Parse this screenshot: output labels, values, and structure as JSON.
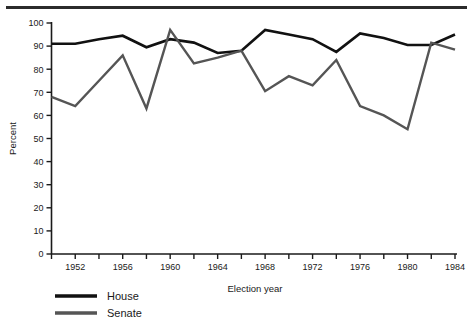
{
  "chart_data": {
    "type": "line",
    "title": "",
    "xlabel": "Election year",
    "ylabel": "Percent",
    "xlim": [
      1950,
      1984
    ],
    "ylim": [
      0,
      100
    ],
    "grid": false,
    "legend_position": "below-left",
    "x": [
      1950,
      1952,
      1954,
      1956,
      1958,
      1960,
      1962,
      1964,
      1966,
      1968,
      1970,
      1972,
      1974,
      1976,
      1978,
      1980,
      1982,
      1984
    ],
    "x_tick_values": [
      1950,
      1952,
      1954,
      1956,
      1958,
      1960,
      1962,
      1964,
      1966,
      1968,
      1970,
      1972,
      1974,
      1976,
      1978,
      1980,
      1982,
      1984
    ],
    "x_tick_labels": [
      "",
      "1952",
      "",
      "1956",
      "",
      "1960",
      "",
      "1964",
      "",
      "1968",
      "",
      "1972",
      "",
      "1976",
      "",
      "1980",
      "",
      "1984"
    ],
    "y_tick_values": [
      0,
      10,
      20,
      30,
      40,
      50,
      60,
      70,
      80,
      90,
      100
    ],
    "y_tick_labels": [
      "0",
      "10",
      "20",
      "30",
      "40",
      "50",
      "60",
      "70",
      "80",
      "90",
      "100"
    ],
    "series": [
      {
        "name": "House",
        "color": "#111111",
        "values": [
          91,
          91,
          93,
          94.5,
          89.5,
          93,
          91.5,
          87,
          88,
          97,
          95,
          93,
          87.5,
          95.5,
          93.5,
          90.5,
          90.5,
          95
        ]
      },
      {
        "name": "Senate",
        "color": "#555555",
        "values": [
          68,
          64,
          75,
          86,
          63,
          97,
          82.5,
          85,
          88,
          70.5,
          77,
          73,
          84,
          64,
          60,
          54,
          91.5,
          88.5
        ]
      }
    ]
  },
  "legend": {
    "entries": [
      {
        "label": "House",
        "color": "#111111"
      },
      {
        "label": "Senate",
        "color": "#555555"
      }
    ]
  },
  "axes": {
    "x_axis_title": "Election year",
    "y_axis_title": "Percent"
  }
}
